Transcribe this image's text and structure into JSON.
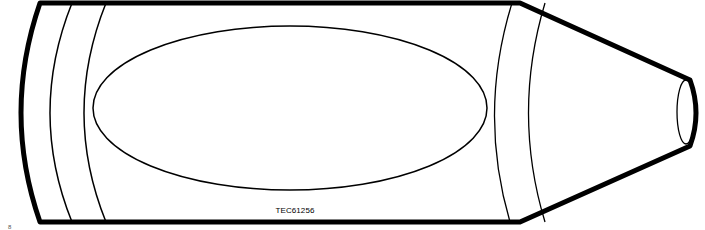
{
  "diagram": {
    "caption": "TEC61256",
    "corner_mark": "8",
    "colors": {
      "stroke": "#000000",
      "fill": "#ffffff"
    }
  }
}
